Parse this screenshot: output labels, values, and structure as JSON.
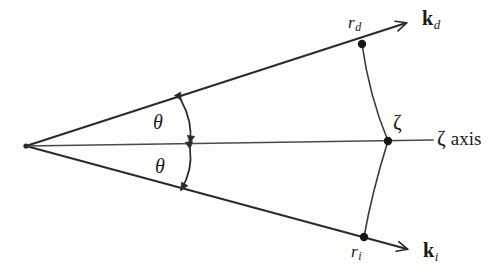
{
  "figure": {
    "kind": "scattering-geometry-diagram",
    "background_color": "#fdfdfc",
    "stroke_color": "#2b2b2b"
  },
  "labels": {
    "theta_upper": "θ",
    "theta_lower": "θ",
    "zeta_point": "ζ",
    "zeta_axis_glyph": "ζ",
    "zeta_axis_word": "axis",
    "r_d_base": "r",
    "r_d_sub": "d",
    "r_i_base": "r",
    "r_i_sub": "i",
    "k_d_base": "k",
    "k_d_sub": "d",
    "k_i_base": "k",
    "k_i_sub": "i"
  },
  "geometry": {
    "apex": {
      "x": 26,
      "y": 146
    },
    "point_r_d": {
      "x": 362,
      "y": 44
    },
    "point_r_i": {
      "x": 364,
      "y": 237
    },
    "point_zeta": {
      "x": 388,
      "y": 141
    },
    "axis_end": {
      "x": 433,
      "y": 140
    },
    "k_d_arrow_tip": {
      "x": 413,
      "y": 20
    },
    "k_i_arrow_tip": {
      "x": 414,
      "y": 252
    },
    "arc_upper": {
      "start_x": 181,
      "start_y": 100,
      "end_x": 190,
      "end_y": 143
    },
    "arc_lower": {
      "start_x": 190,
      "start_y": 149,
      "end_x": 181,
      "end_y": 190
    },
    "dot_radius": 4.2
  },
  "label_positions": {
    "theta_upper": {
      "x": 153,
      "y": 112
    },
    "theta_lower": {
      "x": 155,
      "y": 156
    },
    "zeta_point": {
      "x": 393,
      "y": 112
    },
    "zeta_axis": {
      "x": 437,
      "y": 128
    },
    "r_d": {
      "x": 348,
      "y": 14
    },
    "r_i": {
      "x": 351,
      "y": 243
    },
    "k_d": {
      "x": 422,
      "y": 8
    },
    "k_i": {
      "x": 423,
      "y": 240
    }
  }
}
